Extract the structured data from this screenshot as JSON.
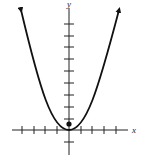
{
  "diagram": {
    "type": "parabola-graph",
    "axes": {
      "x_label": "x",
      "y_label": "y",
      "x_ticks_negative": 4,
      "x_ticks_positive": 4,
      "y_ticks_positive": 9,
      "y_ticks_negative": 1
    },
    "curve": {
      "shape": "upward-opening parabola",
      "vertex": [
        0,
        0
      ],
      "arrows_on_ends": true
    },
    "focus_point": {
      "approx_coords": [
        0,
        0.5
      ]
    },
    "colors": {
      "stroke": "#111111",
      "background": "#ffffff"
    }
  }
}
